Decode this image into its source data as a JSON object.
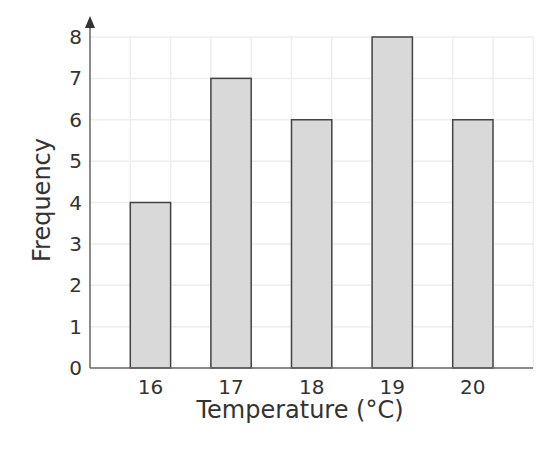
{
  "chart_data": {
    "type": "bar",
    "title": "",
    "xlabel": "Temperature (°C)",
    "ylabel": "Frequency",
    "categories": [
      "16",
      "17",
      "18",
      "19",
      "20"
    ],
    "values": [
      4,
      7,
      6,
      8,
      6
    ],
    "ylim": [
      0,
      8
    ],
    "yticks": [
      "0",
      "1",
      "2",
      "3",
      "4",
      "5",
      "6",
      "7",
      "8"
    ],
    "grid": true,
    "legend": null,
    "colors": {
      "bar_fill": "#d9d9d9",
      "bar_stroke": "#444444",
      "grid": "#eeeeee",
      "axis": "#666666",
      "text": "#333333"
    }
  }
}
